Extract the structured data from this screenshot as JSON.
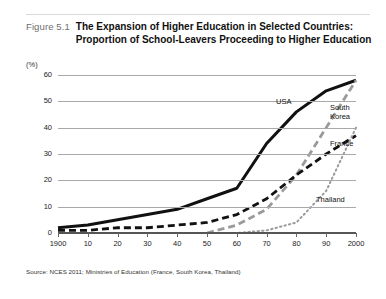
{
  "figure": {
    "number": "Figure 5.1",
    "title_line1": "The Expansion of Higher Education in Selected Countries:",
    "title_line2": "Proportion of School-Leavers Proceeding to Higher Education",
    "source": "Source: NCES 2011; Ministries of Education (France, South Korea, Thailand)"
  },
  "chart_data": {
    "type": "line",
    "title": "The Expansion of Higher Education in Selected Countries: Proportion of School-Leavers Proceeding to Higher Education",
    "xlabel": "",
    "ylabel": "(%)",
    "y_unit": "(%)",
    "xlim": [
      1900,
      2000
    ],
    "ylim": [
      0,
      60
    ],
    "yticks": [
      0,
      10,
      20,
      30,
      40,
      50,
      60
    ],
    "ytick_labels": [
      "0",
      "10",
      "20",
      "30",
      "40",
      "50",
      "60"
    ],
    "xticks": [
      1900,
      1910,
      1920,
      1930,
      1940,
      1950,
      1960,
      1970,
      1980,
      1990,
      2000
    ],
    "xtick_labels": [
      "1900",
      "10",
      "20",
      "30",
      "40",
      "50",
      "60",
      "70",
      "80",
      "90",
      "2000"
    ],
    "grid": true,
    "legend_position": "inline-right",
    "series": [
      {
        "name": "USA",
        "label": "USA",
        "style": "solid",
        "color": "#111111",
        "x": [
          1900,
          1910,
          1920,
          1930,
          1940,
          1950,
          1960,
          1970,
          1980,
          1990,
          2000
        ],
        "values": [
          2,
          3,
          5,
          7,
          9,
          13,
          17,
          34,
          46,
          54,
          58
        ]
      },
      {
        "name": "South Korea",
        "label_line1": "South",
        "label_line2": "Korea",
        "style": "dashed",
        "color": "#9a9a9a",
        "x": [
          1950,
          1960,
          1970,
          1980,
          1990,
          2000
        ],
        "values": [
          0,
          3,
          9,
          22,
          40,
          58
        ]
      },
      {
        "name": "France",
        "label": "France",
        "style": "dashed",
        "color": "#111111",
        "x": [
          1900,
          1910,
          1920,
          1930,
          1940,
          1950,
          1960,
          1970,
          1980,
          1990,
          2000
        ],
        "values": [
          1,
          1,
          2,
          2,
          3,
          4,
          7,
          13,
          22,
          30,
          37
        ]
      },
      {
        "name": "Thailand",
        "label": "Thailand",
        "style": "dotted",
        "color": "#9a9a9a",
        "x": [
          1950,
          1960,
          1970,
          1980,
          1990,
          2000
        ],
        "values": [
          0,
          0,
          1,
          4,
          16,
          40
        ]
      }
    ]
  }
}
